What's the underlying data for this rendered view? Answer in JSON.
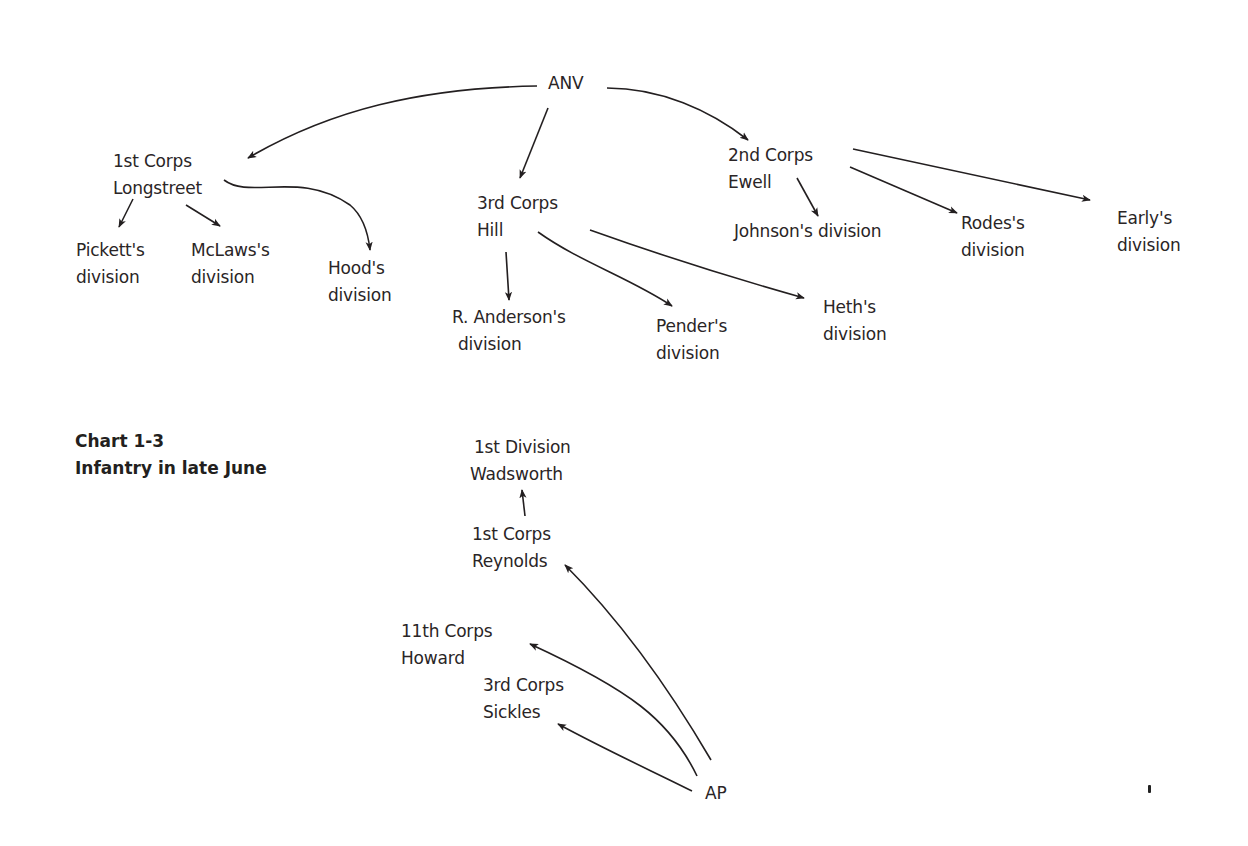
{
  "chart_title": {
    "line1": "Chart 1-3",
    "line2": "Infantry in late June"
  },
  "nodes": {
    "anv": {
      "line1": "ANV"
    },
    "corps1_csa": {
      "line1": "1st Corps",
      "line2": "Longstreet"
    },
    "pickett": {
      "line1": "Pickett's",
      "line2": "division"
    },
    "mclaws": {
      "line1": "McLaws's",
      "line2": "division"
    },
    "hood": {
      "line1": "Hood's",
      "line2": "division"
    },
    "corps3_csa": {
      "line1": "3rd Corps",
      "line2": "Hill"
    },
    "anderson": {
      "line1": "R.  Anderson's",
      "line2": "division"
    },
    "pender": {
      "line1": "Pender's",
      "line2": "division"
    },
    "heth": {
      "line1": "Heth's",
      "line2": "division"
    },
    "corps2_csa": {
      "line1": "2nd Corps",
      "line2": "Ewell"
    },
    "johnson": {
      "line1": "Johnson's division"
    },
    "rodes": {
      "line1": "Rodes's",
      "line2": "division"
    },
    "early": {
      "line1": "Early's",
      "line2": "division"
    },
    "ap": {
      "line1": "AP"
    },
    "corps1_usa": {
      "line1": "1st Corps",
      "line2": "Reynolds"
    },
    "div1_usa": {
      "line1": "1st Division",
      "line2": "Wadsworth"
    },
    "corps11_usa": {
      "line1": "11th Corps",
      "line2": "Howard"
    },
    "corps3_usa": {
      "line1": "3rd Corps",
      "line2": "Sickles"
    }
  },
  "edges": [
    {
      "from": "ANV",
      "to": "1st Corps Longstreet"
    },
    {
      "from": "ANV",
      "to": "3rd Corps Hill"
    },
    {
      "from": "ANV",
      "to": "2nd Corps Ewell"
    },
    {
      "from": "1st Corps Longstreet",
      "to": "Pickett's division"
    },
    {
      "from": "1st Corps Longstreet",
      "to": "McLaws's division"
    },
    {
      "from": "1st Corps Longstreet",
      "to": "Hood's division"
    },
    {
      "from": "3rd Corps Hill",
      "to": "R. Anderson's division"
    },
    {
      "from": "3rd Corps Hill",
      "to": "Pender's division"
    },
    {
      "from": "3rd Corps Hill",
      "to": "Heth's division"
    },
    {
      "from": "2nd Corps Ewell",
      "to": "Johnson's division"
    },
    {
      "from": "2nd Corps Ewell",
      "to": "Rodes's division"
    },
    {
      "from": "2nd Corps Ewell",
      "to": "Early's division"
    },
    {
      "from": "AP",
      "to": "1st Corps Reynolds"
    },
    {
      "from": "1st Corps Reynolds",
      "to": "1st Division Wadsworth"
    },
    {
      "from": "AP",
      "to": "11th Corps Howard"
    },
    {
      "from": "AP",
      "to": "3rd Corps Sickles"
    }
  ],
  "colors": {
    "ink": "#231f20",
    "background": "#ffffff"
  }
}
